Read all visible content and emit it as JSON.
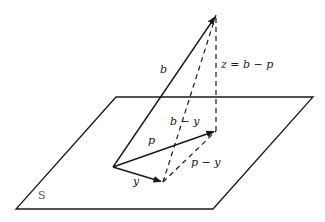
{
  "diagram": {
    "type": "vector-projection",
    "colors": {
      "stroke": "#1a1a1a",
      "plane_label": "#555555",
      "background": "#ffffff"
    },
    "plane": {
      "label": "S",
      "corners": [
        [
          116,
          97
        ],
        [
          313,
          97
        ],
        [
          213,
          209
        ],
        [
          16,
          209
        ]
      ]
    },
    "vectors": [
      {
        "name": "b",
        "label": "b",
        "from": [
          113,
          167
        ],
        "to": [
          216,
          15
        ],
        "style": "solid",
        "arrow": true
      },
      {
        "name": "p",
        "label": "p",
        "from": [
          113,
          167
        ],
        "to": [
          216,
          131
        ],
        "style": "solid",
        "arrow": true
      },
      {
        "name": "y",
        "label": "y",
        "from": [
          113,
          167
        ],
        "to": [
          163,
          182
        ],
        "style": "solid",
        "arrow": true
      }
    ],
    "dashed_segments": [
      {
        "name": "b-minus-y",
        "label": "b − y",
        "from": [
          163,
          182
        ],
        "to": [
          216,
          15
        ]
      },
      {
        "name": "z",
        "label": "z = b − p",
        "from": [
          216,
          131
        ],
        "to": [
          216,
          15
        ]
      },
      {
        "name": "p-minus-y",
        "label": "p − y",
        "from": [
          163,
          182
        ],
        "to": [
          216,
          131
        ]
      }
    ],
    "labels": {
      "b": "b",
      "p": "p",
      "y": "y",
      "b_minus_y": "b − y",
      "z_eq": "z = b − p",
      "p_minus_y": "p − y",
      "plane": "S"
    }
  }
}
